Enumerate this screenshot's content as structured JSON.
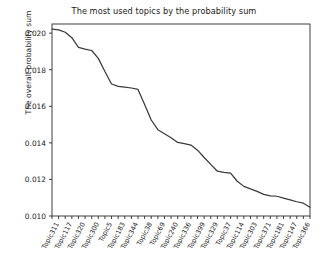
{
  "chart_data": {
    "type": "line",
    "title": "The most used topics by the probability sum",
    "xlabel": "",
    "ylabel": "The overall probability sum",
    "ylim": [
      0.01,
      0.0205
    ],
    "yticks": [
      0.01,
      0.012,
      0.014,
      0.016,
      0.018,
      0.02
    ],
    "ytick_labels": [
      "0.010",
      "0.012",
      "0.014",
      "0.016",
      "0.018",
      "0.020"
    ],
    "grid": false,
    "legend": null,
    "line_color": "#3a3a3a",
    "categories": [
      "Topic311",
      "Topic326",
      "Topic117",
      "Topic208",
      "Topic320",
      "Topic157",
      "Topic300",
      "Topic45",
      "Topic5",
      "Topic92",
      "Topic183",
      "Topic271",
      "Topic344",
      "Topic60",
      "Topic38",
      "Topic219",
      "Topic69",
      "Topic134",
      "Topic240",
      "Topic88",
      "Topic336",
      "Topic175",
      "Topic399",
      "Topic260",
      "Topic329",
      "Topic18",
      "Topic37",
      "Topic204",
      "Topic114",
      "Topic96",
      "Topic303",
      "Topic250",
      "Topic371",
      "Topic129",
      "Topic181",
      "Topic77",
      "Topic147",
      "Topic212",
      "Topic366",
      "Topic54"
    ],
    "tick_labels_visible": [
      "Topic311",
      "Topic117",
      "Topic320",
      "Topic300",
      "Topic5",
      "Topic183",
      "Topic344",
      "Topic38",
      "Topic69",
      "Topic240",
      "Topic336",
      "Topic399",
      "Topic329",
      "Topic37",
      "Topic114",
      "Topic303",
      "Topic371",
      "Topic181",
      "Topic147",
      "Topic366"
    ],
    "values": [
      0.02022,
      0.02018,
      0.02005,
      0.01975,
      0.01922,
      0.01913,
      0.01905,
      0.01862,
      0.0179,
      0.01722,
      0.01709,
      0.01705,
      0.017,
      0.01692,
      0.0161,
      0.01525,
      0.01472,
      0.0145,
      0.01428,
      0.01402,
      0.01396,
      0.01388,
      0.0136,
      0.0132,
      0.01282,
      0.01245,
      0.01238,
      0.01235,
      0.0119,
      0.01162,
      0.01148,
      0.01135,
      0.01118,
      0.0111,
      0.01108,
      0.01098,
      0.01088,
      0.01078,
      0.0107,
      0.01048
    ]
  }
}
